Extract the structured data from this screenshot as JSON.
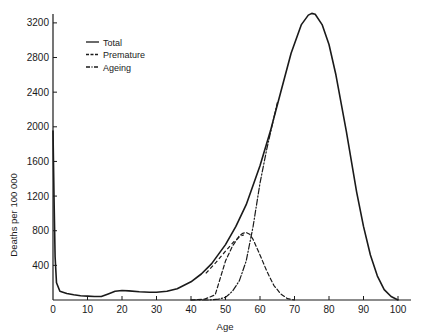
{
  "chart_data": {
    "type": "line",
    "title": "",
    "xlabel": "Age",
    "ylabel": "Deaths per 100 000",
    "xlim": [
      0,
      100
    ],
    "ylim": [
      0,
      3300
    ],
    "grid": false,
    "legend_position": "upper-left",
    "x_ticks": [
      0,
      10,
      20,
      30,
      40,
      50,
      60,
      70,
      80,
      90,
      100
    ],
    "y_ticks": [
      400,
      800,
      1200,
      1600,
      2000,
      2400,
      2800,
      3200
    ],
    "series": [
      {
        "name": "Total",
        "style": "solid",
        "x": [
          0,
          0.3,
          0.6,
          1,
          2,
          4,
          6,
          8,
          10,
          12,
          14,
          16,
          18,
          20,
          22,
          25,
          28,
          30,
          33,
          36,
          40,
          43,
          46,
          50,
          53,
          56,
          60,
          63,
          66,
          69,
          72,
          74,
          75,
          76,
          78,
          80,
          82,
          85,
          88,
          90,
          92,
          94,
          96,
          98,
          100
        ],
        "y": [
          1950,
          1200,
          500,
          200,
          100,
          75,
          60,
          50,
          45,
          40,
          40,
          70,
          100,
          110,
          105,
          95,
          90,
          90,
          100,
          130,
          210,
          300,
          420,
          640,
          850,
          1100,
          1550,
          1950,
          2400,
          2850,
          3180,
          3290,
          3310,
          3300,
          3180,
          2950,
          2600,
          1950,
          1250,
          850,
          520,
          280,
          120,
          40,
          0
        ]
      },
      {
        "name": "Premature",
        "style": "dashed",
        "x": [
          40,
          44,
          47,
          50,
          52,
          54,
          55,
          56,
          57,
          58,
          60,
          62,
          64,
          66,
          68,
          70
        ],
        "y": [
          0,
          10,
          60,
          450,
          620,
          740,
          770,
          780,
          760,
          700,
          520,
          330,
          170,
          70,
          15,
          0
        ],
        "note": "Upper branch of premature curve follows total below age ~52"
      },
      {
        "name": "Ageing",
        "style": "dash-dot",
        "x": [
          40,
          45,
          48,
          50,
          52,
          54,
          56,
          58,
          60,
          62,
          64,
          65
        ],
        "y": [
          0,
          0,
          10,
          30,
          100,
          220,
          450,
          850,
          1350,
          1750,
          2100,
          2280
        ]
      }
    ]
  },
  "legend": {
    "items": [
      {
        "label": "Total",
        "style": "solid"
      },
      {
        "label": "Premature",
        "style": "dashed"
      },
      {
        "label": "Ageing",
        "style": "dash-dot"
      }
    ]
  },
  "axes": {
    "xlabel": "Age",
    "ylabel": "Deaths per 100 000",
    "x_tick_labels": [
      "0",
      "10",
      "20",
      "30",
      "40",
      "50",
      "60",
      "70",
      "80",
      "90",
      "100"
    ],
    "y_tick_labels": [
      "400",
      "800",
      "1200",
      "1600",
      "2000",
      "2400",
      "2800",
      "3200"
    ]
  },
  "colors": {
    "ink": "#1a1a1a",
    "background": "#ffffff"
  }
}
